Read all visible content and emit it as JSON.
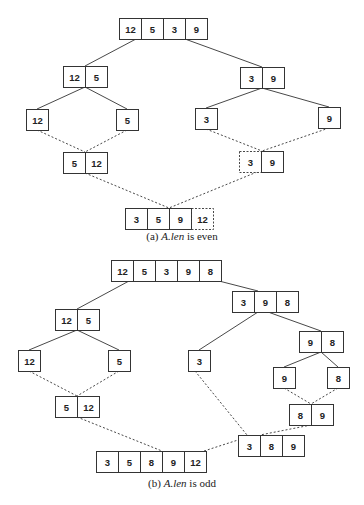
{
  "figures": [
    {
      "id": "a",
      "caption_prefix": "(a) ",
      "caption_var": "A.len",
      "caption_suffix": " is even",
      "nodes": [
        {
          "id": "a_root",
          "x": 119,
          "y": 18,
          "values": [
            "12",
            "5",
            "3",
            "9"
          ],
          "dashed": []
        },
        {
          "id": "a_l",
          "x": 63,
          "y": 66,
          "values": [
            "12",
            "5"
          ],
          "dashed": []
        },
        {
          "id": "a_r",
          "x": 240,
          "y": 67,
          "values": [
            "3",
            "9"
          ],
          "dashed": []
        },
        {
          "id": "a_ll",
          "x": 26,
          "y": 109,
          "values": [
            "12"
          ],
          "dashed": []
        },
        {
          "id": "a_lr",
          "x": 116,
          "y": 109,
          "values": [
            "5"
          ],
          "dashed": []
        },
        {
          "id": "a_rl",
          "x": 195,
          "y": 108,
          "values": [
            "3"
          ],
          "dashed": []
        },
        {
          "id": "a_rr",
          "x": 318,
          "y": 107,
          "values": [
            "9"
          ],
          "dashed": []
        },
        {
          "id": "a_lm",
          "x": 63,
          "y": 152,
          "values": [
            "5",
            "12"
          ],
          "dashed": []
        },
        {
          "id": "a_rm",
          "x": 239,
          "y": 151,
          "values": [
            "3",
            "9"
          ],
          "dashed": [
            0
          ]
        },
        {
          "id": "a_final",
          "x": 125,
          "y": 208,
          "values": [
            "3",
            "5",
            "9",
            "12"
          ],
          "dashed": [
            3
          ]
        }
      ],
      "split_edges": [
        [
          136,
          39,
          85,
          66
        ],
        [
          185,
          39,
          262,
          67
        ],
        [
          85,
          87,
          37,
          109
        ],
        [
          85,
          87,
          127,
          109
        ],
        [
          262,
          88,
          206,
          108
        ],
        [
          262,
          88,
          329,
          107
        ]
      ],
      "merge_edges": [
        [
          37,
          130,
          85,
          152
        ],
        [
          127,
          130,
          85,
          152
        ],
        [
          206,
          129,
          262,
          151
        ],
        [
          329,
          128,
          262,
          151
        ],
        [
          85,
          173,
          169,
          208
        ],
        [
          257,
          172,
          169,
          208
        ]
      ],
      "caption_y": 240
    },
    {
      "id": "b",
      "caption_prefix": "(b) ",
      "caption_var": "A.len",
      "caption_suffix": " is odd",
      "nodes": [
        {
          "id": "b_root",
          "x": 111,
          "y": 260,
          "values": [
            "12",
            "5",
            "3",
            "9",
            "8"
          ],
          "dashed": []
        },
        {
          "id": "b_l",
          "x": 55,
          "y": 309,
          "values": [
            "12",
            "5"
          ],
          "dashed": []
        },
        {
          "id": "b_r",
          "x": 232,
          "y": 291,
          "values": [
            "3",
            "9",
            "8"
          ],
          "dashed": []
        },
        {
          "id": "b_ll",
          "x": 18,
          "y": 350,
          "values": [
            "12"
          ],
          "dashed": []
        },
        {
          "id": "b_lr",
          "x": 108,
          "y": 350,
          "values": [
            "5"
          ],
          "dashed": []
        },
        {
          "id": "b_rl",
          "x": 188,
          "y": 350,
          "values": [
            "3"
          ],
          "dashed": []
        },
        {
          "id": "b_rr",
          "x": 299,
          "y": 331,
          "values": [
            "9",
            "8"
          ],
          "dashed": []
        },
        {
          "id": "b_rrl",
          "x": 273,
          "y": 367,
          "values": [
            "9"
          ],
          "dashed": []
        },
        {
          "id": "b_rrr",
          "x": 327,
          "y": 367,
          "values": [
            "8"
          ],
          "dashed": []
        },
        {
          "id": "b_lm",
          "x": 55,
          "y": 396,
          "values": [
            "5",
            "12"
          ],
          "dashed": []
        },
        {
          "id": "b_rrm",
          "x": 289,
          "y": 404,
          "values": [
            "8",
            "9"
          ],
          "dashed": []
        },
        {
          "id": "b_rm",
          "x": 238,
          "y": 435,
          "values": [
            "3",
            "8",
            "9"
          ],
          "dashed": []
        },
        {
          "id": "b_final",
          "x": 96,
          "y": 451,
          "values": [
            "3",
            "5",
            "8",
            "9",
            "12"
          ],
          "dashed": []
        }
      ],
      "split_edges": [
        [
          129,
          281,
          77,
          309
        ],
        [
          219,
          281,
          258,
          291
        ],
        [
          77,
          330,
          29,
          350
        ],
        [
          77,
          330,
          119,
          350
        ],
        [
          258,
          312,
          199,
          350
        ],
        [
          268,
          312,
          321,
          331
        ],
        [
          321,
          352,
          284,
          367
        ],
        [
          321,
          352,
          338,
          367
        ]
      ],
      "merge_edges": [
        [
          29,
          371,
          77,
          396
        ],
        [
          119,
          371,
          77,
          396
        ],
        [
          284,
          388,
          311,
          404
        ],
        [
          338,
          388,
          311,
          404
        ],
        [
          195,
          371,
          247,
          435
        ],
        [
          311,
          425,
          260,
          435
        ],
        [
          77,
          417,
          162,
          451
        ],
        [
          204,
          451,
          238,
          440
        ]
      ],
      "caption_y": 487
    }
  ],
  "style": {
    "cell_width": 22,
    "cell_height": 21,
    "line_color": "#333333",
    "box_color": "#333333",
    "background": "#ffffff"
  }
}
